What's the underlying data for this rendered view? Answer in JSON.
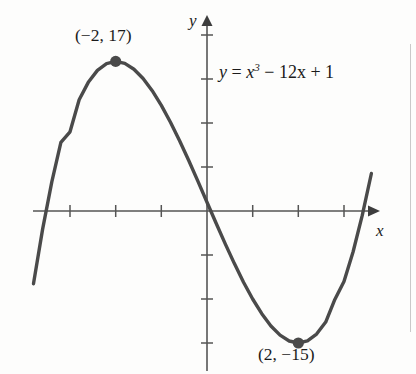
{
  "figure": {
    "name": "cubic-function-graph",
    "background_color": "#fdfdfc",
    "curve_color": "#4a4a4a",
    "axis_color": "#555555",
    "text_color": "#1b1b1b"
  },
  "labels": {
    "maximum_point": "(−2, 17)",
    "minimum_point": "(2, −15)",
    "equation_y": "y",
    "equation_equals": "=",
    "equation_x": "x",
    "equation_exponent": "3",
    "equation_rest": "− 12x + 1",
    "axis_x": "x",
    "axis_y": "y"
  },
  "chart_data": {
    "type": "line",
    "title": "",
    "subtitle": "",
    "xlabel": "x",
    "ylabel": "y",
    "annotations": [
      {
        "text": "(−2, 17)",
        "x": -2,
        "y": 17,
        "role": "local-maximum",
        "marker": "filled-dot"
      },
      {
        "text": "(2, −15)",
        "x": 2,
        "y": -15,
        "role": "local-minimum",
        "marker": "filled-dot"
      },
      {
        "text": "y = x^3 − 12x + 1",
        "role": "equation-label"
      }
    ],
    "grid": false,
    "legend": null,
    "xlim": [
      -3.8,
      3.7
    ],
    "ylim": [
      -24,
      23
    ],
    "x_tick_values": [
      -3,
      -2,
      -1,
      1,
      2,
      3
    ],
    "y_tick_values": [
      -15,
      -10,
      -5,
      5,
      10,
      15,
      20
    ],
    "x_tick_labels": [],
    "y_tick_labels": [],
    "axis_arrows": [
      "x-positive",
      "y-positive"
    ],
    "series": [
      {
        "name": "y = x^3 - 12x + 1",
        "equation": "y = x^3 - 12x + 1",
        "color": "#4a4a4a",
        "x": [
          -3.8,
          -3.6,
          -3.4,
          -3.2,
          -3.0,
          -2.8,
          -2.6,
          -2.4,
          -2.2,
          -2.0,
          -1.8,
          -1.6,
          -1.4,
          -1.2,
          -1.0,
          -0.8,
          -0.6,
          -0.4,
          -0.2,
          0.0,
          0.2,
          0.4,
          0.6,
          0.8,
          1.0,
          1.2,
          1.4,
          1.6,
          1.8,
          2.0,
          2.2,
          2.4,
          2.6,
          2.8,
          3.0,
          3.2,
          3.4,
          3.6
        ],
        "y": [
          -8.27,
          -2.06,
          3.28,
          7.79,
          9.0,
          12.65,
          14.62,
          15.98,
          16.75,
          17.0,
          16.77,
          16.11,
          15.06,
          13.67,
          12.0,
          10.09,
          7.99,
          5.74,
          3.39,
          1.0,
          -1.39,
          -3.74,
          -5.98,
          -8.09,
          -10.0,
          -11.67,
          -13.06,
          -14.11,
          -14.77,
          -15.0,
          -14.75,
          -13.98,
          -12.62,
          -10.05,
          -8.0,
          -4.63,
          -0.5,
          4.26
        ]
      }
    ],
    "markers": [
      {
        "x": -2,
        "y": 17,
        "style": "filled-circle",
        "color": "#4a4a4a"
      },
      {
        "x": 2,
        "y": -15,
        "style": "filled-circle",
        "color": "#4a4a4a"
      }
    ]
  }
}
